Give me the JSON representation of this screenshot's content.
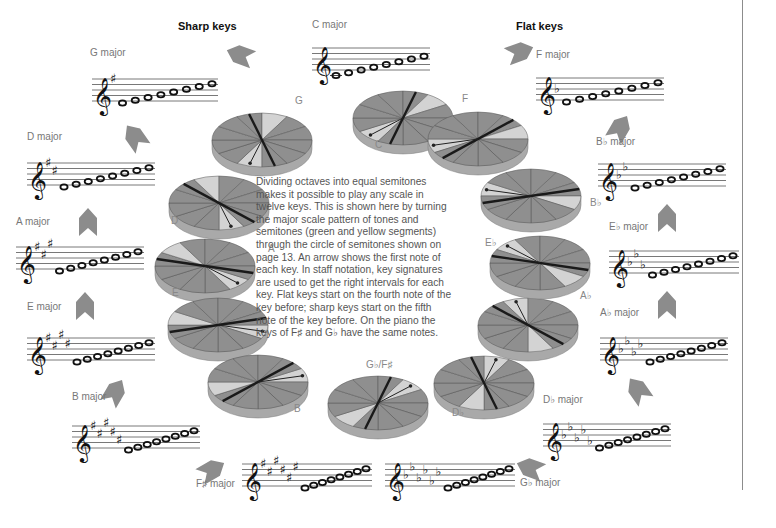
{
  "headings": {
    "sharp": {
      "label": "Sharp keys",
      "x": 178,
      "y": 26
    },
    "flat": {
      "label": "Flat keys",
      "x": 516,
      "y": 26
    }
  },
  "description": "Dividing octaves into equal semitones makes it possible to play any scale in twelve keys. This is shown here by turning the major scale pattern of tones and semitones (green and yellow segments) through the circle of semitones shown on page 13. An arrow shows the first note of each key. In staff notation, key signatures are used to get the right intervals for each key. Flat keys start on the fourth note of the key before; sharp keys start on the fifth note of the key before. On the piano the keys of F♯ and G♭ have the same notes.",
  "colors": {
    "tone_segment": "#8f8f8f",
    "semitone_segment": "#d3d3d3",
    "wheel_side": "#a9a9a9",
    "divider": "#1a1a1a",
    "arrow": "#8c8c8c",
    "staff_line": "#555555",
    "label": "#777777"
  },
  "keys": [
    {
      "id": "c",
      "label": "C major",
      "lx": 312,
      "ly": 28,
      "staff": {
        "x": 312,
        "y": 48,
        "w": 118
      },
      "acc": "none",
      "count": 0,
      "ledger": true
    },
    {
      "id": "g",
      "label": "G major",
      "lx": 90,
      "ly": 56,
      "staff": {
        "x": 92,
        "y": 79,
        "w": 126
      },
      "acc": "sharp",
      "count": 1
    },
    {
      "id": "d",
      "label": "D major",
      "lx": 27,
      "ly": 140,
      "staff": {
        "x": 27,
        "y": 163,
        "w": 128
      },
      "acc": "sharp",
      "count": 2
    },
    {
      "id": "a",
      "label": "A major",
      "lx": 16,
      "ly": 225,
      "staff": {
        "x": 16,
        "y": 247,
        "w": 128
      },
      "acc": "sharp",
      "count": 3
    },
    {
      "id": "e",
      "label": "E major",
      "lx": 27,
      "ly": 310,
      "staff": {
        "x": 27,
        "y": 338,
        "w": 128
      },
      "acc": "sharp",
      "count": 4
    },
    {
      "id": "b",
      "label": "B major",
      "lx": 72,
      "ly": 400,
      "staff": {
        "x": 72,
        "y": 426,
        "w": 128
      },
      "acc": "sharp",
      "count": 5
    },
    {
      "id": "fs",
      "label": "F♯ major",
      "lx": 196,
      "ly": 487,
      "staff": {
        "x": 242,
        "y": 464,
        "w": 130
      },
      "acc": "sharp",
      "count": 6
    },
    {
      "id": "f",
      "label": "F major",
      "lx": 536,
      "ly": 58,
      "staff": {
        "x": 536,
        "y": 78,
        "w": 128
      },
      "acc": "flat",
      "count": 1
    },
    {
      "id": "bb",
      "label": "B♭ major",
      "lx": 596,
      "ly": 145,
      "staff": {
        "x": 598,
        "y": 164,
        "w": 128
      },
      "acc": "flat",
      "count": 2
    },
    {
      "id": "eb",
      "label": "E♭ major",
      "lx": 609,
      "ly": 230,
      "staff": {
        "x": 609,
        "y": 251,
        "w": 130
      },
      "acc": "flat",
      "count": 3
    },
    {
      "id": "ab",
      "label": "A♭ major",
      "lx": 600,
      "ly": 316,
      "staff": {
        "x": 600,
        "y": 338,
        "w": 128
      },
      "acc": "flat",
      "count": 4
    },
    {
      "id": "db",
      "label": "D♭ major",
      "lx": 543,
      "ly": 403,
      "staff": {
        "x": 543,
        "y": 424,
        "w": 128
      },
      "acc": "flat",
      "count": 5
    },
    {
      "id": "gb",
      "label": "G♭ major",
      "lx": 520,
      "ly": 486,
      "staff": {
        "x": 385,
        "y": 464,
        "w": 130
      },
      "acc": "flat",
      "count": 6
    }
  ],
  "wheels": [
    {
      "label": "C",
      "cx": 403,
      "cy": 118,
      "rx": 50,
      "ry": 27,
      "rot": 120,
      "lx": 375,
      "ly": 148
    },
    {
      "label": "G",
      "cx": 262,
      "cy": 140,
      "rx": 50,
      "ry": 27,
      "rot": 90,
      "lx": 295,
      "ly": 104
    },
    {
      "label": "D",
      "cx": 219,
      "cy": 203,
      "rx": 50,
      "ry": 27,
      "rot": 60,
      "lx": 171,
      "ly": 224
    },
    {
      "label": "A",
      "cx": 205,
      "cy": 266,
      "rx": 50,
      "ry": 27,
      "rot": 30,
      "lx": 268,
      "ly": 252
    },
    {
      "label": "E",
      "cx": 218,
      "cy": 325,
      "rx": 50,
      "ry": 27,
      "rot": 0,
      "lx": 172,
      "ly": 296
    },
    {
      "label": "B",
      "cx": 258,
      "cy": 382,
      "rx": 50,
      "ry": 27,
      "rot": -30,
      "lx": 294,
      "ly": 412
    },
    {
      "label": "G♭/F♯",
      "cx": 378,
      "cy": 403,
      "rx": 50,
      "ry": 27,
      "rot": -60,
      "lx": 366,
      "ly": 368
    },
    {
      "label": "D♭",
      "cx": 484,
      "cy": 383,
      "rx": 50,
      "ry": 27,
      "rot": -90,
      "lx": 452,
      "ly": 416
    },
    {
      "label": "A♭",
      "cx": 528,
      "cy": 325,
      "rx": 50,
      "ry": 27,
      "rot": -120,
      "lx": 580,
      "ly": 299
    },
    {
      "label": "E♭",
      "cx": 540,
      "cy": 263,
      "rx": 50,
      "ry": 27,
      "rot": -150,
      "lx": 485,
      "ly": 246
    },
    {
      "label": "B♭",
      "cx": 531,
      "cy": 196,
      "rx": 50,
      "ry": 27,
      "rot": 180,
      "lx": 590,
      "ly": 206
    },
    {
      "label": "F",
      "cx": 478,
      "cy": 139,
      "rx": 50,
      "ry": 27,
      "rot": 150,
      "lx": 462,
      "ly": 102
    }
  ],
  "arrows": [
    {
      "id": "to-g",
      "x": 240,
      "y": 55,
      "angle": 200
    },
    {
      "id": "to-d",
      "x": 135,
      "y": 137,
      "angle": 235
    },
    {
      "id": "to-a",
      "x": 88,
      "y": 222,
      "angle": 270
    },
    {
      "id": "to-e",
      "x": 85,
      "y": 306,
      "angle": 270
    },
    {
      "id": "to-b",
      "x": 115,
      "y": 392,
      "angle": 300
    },
    {
      "id": "to-fs",
      "x": 212,
      "y": 470,
      "angle": 330
    },
    {
      "id": "to-f",
      "x": 520,
      "y": 52,
      "angle": 340
    },
    {
      "id": "to-bb",
      "x": 620,
      "y": 128,
      "angle": 300
    },
    {
      "id": "to-eb",
      "x": 667,
      "y": 218,
      "angle": 270
    },
    {
      "id": "to-ab",
      "x": 667,
      "y": 305,
      "angle": 270
    },
    {
      "id": "to-db",
      "x": 638,
      "y": 390,
      "angle": 235
    },
    {
      "id": "to-gb",
      "x": 530,
      "y": 468,
      "angle": 200
    }
  ],
  "page_rule": {
    "x": 742,
    "y1": 0,
    "y2": 490
  }
}
